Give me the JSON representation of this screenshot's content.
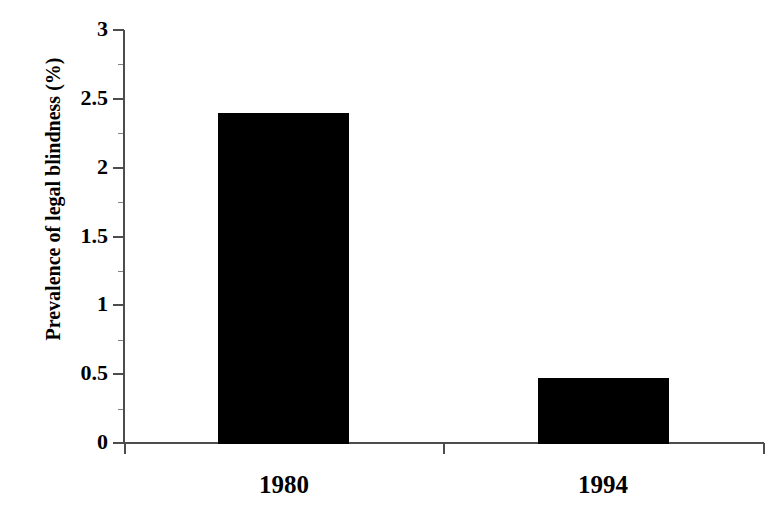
{
  "chart_data": {
    "type": "bar",
    "title": "",
    "categories": [
      "1980",
      "1994"
    ],
    "values": [
      2.4,
      0.47
    ],
    "series": [
      {
        "name": "Prevalence of legal blindness",
        "values": [
          2.4,
          0.47
        ]
      }
    ],
    "xlabel": "",
    "ylabel": "Prevalence of legal blindness (%)",
    "ylim": [
      0,
      3
    ],
    "xlim": [
      0,
      2
    ],
    "ytick_labels": [
      "0",
      "0.5",
      "1",
      "1.5",
      "2",
      "2.5",
      "3"
    ],
    "ytick_values": [
      0,
      0.5,
      1,
      1.5,
      2,
      2.5,
      3
    ],
    "yminor_tick_values": [
      0.25,
      0.75,
      1.25,
      1.75,
      2.25,
      2.75
    ],
    "grid": false,
    "legend": false,
    "legend_position": "none",
    "bar_color": "#000000",
    "axis_color": "#4d4d4d",
    "background_color": "#ffffff"
  },
  "axis": {
    "y_title": "Prevalence of legal blindness (%)"
  },
  "ticks": {
    "y": [
      {
        "label": "3",
        "value": 3
      },
      {
        "label": "2.5",
        "value": 2.5
      },
      {
        "label": "2",
        "value": 2
      },
      {
        "label": "1.5",
        "value": 1.5
      },
      {
        "label": "1",
        "value": 1
      },
      {
        "label": "0.5",
        "value": 0.5
      },
      {
        "label": "0",
        "value": 0
      }
    ],
    "x": [
      {
        "label": "1980"
      },
      {
        "label": "1994"
      }
    ]
  }
}
